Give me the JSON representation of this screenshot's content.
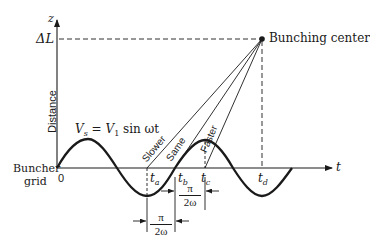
{
  "diagram": {
    "axes": {
      "y_axis_label": "z",
      "x_axis_label": "t",
      "y_axis_title": "Distance",
      "origin_label": "0",
      "y_marker": "ΔL"
    },
    "labels": {
      "bunching_center": "Bunching center",
      "buncher_grid_line1": "Buncher",
      "buncher_grid_line2": "grid",
      "equation_lhs": "V",
      "equation_sub": "s",
      "equation_rest": " = V",
      "equation_sub2": "1",
      "equation_tail": " sin ωt"
    },
    "trajectories": [
      {
        "label": "Slower",
        "start": "t_a"
      },
      {
        "label": "Same",
        "start": "t_b"
      },
      {
        "label": "Faster",
        "start": "t_c"
      }
    ],
    "time_marks": [
      {
        "name": "t",
        "sub": "a"
      },
      {
        "name": "t",
        "sub": "b"
      },
      {
        "name": "t",
        "sub": "c"
      },
      {
        "name": "t",
        "sub": "d"
      }
    ],
    "intervals": [
      {
        "numerator": "π",
        "denominator": "2ω",
        "between": "t_a–t_b"
      },
      {
        "numerator": "π",
        "denominator": "2ω",
        "between": "t_b–t_c"
      }
    ],
    "colors": {
      "ink": "#1a1a1a",
      "background": "#ffffff"
    }
  }
}
